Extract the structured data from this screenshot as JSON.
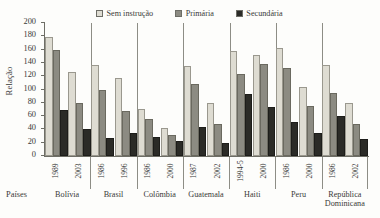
{
  "chart_data": {
    "type": "bar",
    "title": "",
    "xlabel": "Países",
    "ylabel": "Relação",
    "ylim": [
      0,
      200
    ],
    "yticks": [
      0,
      20,
      40,
      60,
      80,
      100,
      120,
      140,
      160,
      180,
      200
    ],
    "grid": false,
    "legend_position": "top-center",
    "series_names": [
      "Sem instrução",
      "Primária",
      "Secundária"
    ],
    "series_colors": [
      "#dedcd2",
      "#8c8b82",
      "#2b2b27"
    ],
    "categories": [
      "Bolívia 1989",
      "Bolívia 2003",
      "Brasil 1986",
      "Brasil 1996",
      "Colômbia 1986",
      "Colômbia 2000",
      "Guatemala 1987",
      "Guatemala 2002",
      "Haiti 1994-5",
      "Haiti 2000",
      "Peru 1986",
      "Peru 2000",
      "República Dominicana 1986",
      "República Dominicana 2002"
    ],
    "series": [
      {
        "name": "Sem instrução",
        "values": [
          179,
          127,
          137,
          118,
          71,
          42,
          136,
          80,
          158,
          152,
          163,
          104,
          137,
          79
        ]
      },
      {
        "name": "Primária",
        "values": [
          159,
          79,
          100,
          67,
          55,
          31,
          109,
          48,
          124,
          139,
          132,
          75,
          95,
          48
        ]
      },
      {
        "name": "Secundária",
        "values": [
          69,
          40,
          27,
          35,
          28,
          22,
          43,
          19,
          94,
          74,
          51,
          34,
          60,
          26
        ]
      }
    ],
    "groups": [
      {
        "country": "Bolívia",
        "country_line2": "",
        "years": [
          {
            "year": "1989",
            "values": [
              179,
              159,
              69
            ]
          },
          {
            "year": "2003",
            "values": [
              127,
              79,
              40
            ]
          }
        ]
      },
      {
        "country": "Brasil",
        "country_line2": "",
        "years": [
          {
            "year": "1986",
            "values": [
              137,
              100,
              27
            ]
          },
          {
            "year": "1996",
            "values": [
              118,
              67,
              35
            ]
          }
        ]
      },
      {
        "country": "Colômbia",
        "country_line2": "",
        "years": [
          {
            "year": "1986",
            "values": [
              71,
              55,
              28
            ]
          },
          {
            "year": "2000",
            "values": [
              42,
              31,
              22
            ]
          }
        ]
      },
      {
        "country": "Guatemala",
        "country_line2": "",
        "years": [
          {
            "year": "1987",
            "values": [
              136,
              109,
              43
            ]
          },
          {
            "year": "2002",
            "values": [
              80,
              48,
              19
            ]
          }
        ]
      },
      {
        "country": "Haiti",
        "country_line2": "",
        "years": [
          {
            "year": "1994-5",
            "values": [
              158,
              124,
              94
            ]
          },
          {
            "year": "2000",
            "values": [
              152,
              139,
              74
            ]
          }
        ]
      },
      {
        "country": "Peru",
        "country_line2": "",
        "years": [
          {
            "year": "1986",
            "values": [
              163,
              132,
              51
            ]
          },
          {
            "year": "2000",
            "values": [
              104,
              75,
              34
            ]
          }
        ]
      },
      {
        "country": "República",
        "country_line2": "Dominicana",
        "years": [
          {
            "year": "1986",
            "values": [
              137,
              95,
              60
            ]
          },
          {
            "year": "2002",
            "values": [
              79,
              48,
              26
            ]
          }
        ]
      }
    ]
  },
  "legend": {
    "items": [
      {
        "label": "Sem instrução",
        "color": "#dedcd2"
      },
      {
        "label": "Primária",
        "color": "#8c8b82"
      },
      {
        "label": "Secundária",
        "color": "#2b2b27"
      }
    ]
  },
  "axes": {
    "y_title": "Relação",
    "x_title": "Países"
  }
}
